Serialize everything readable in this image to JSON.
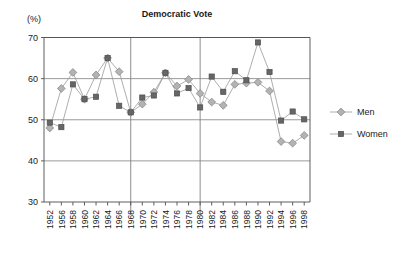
{
  "chart_data": {
    "type": "line",
    "title": "Democratic Vote",
    "ylabel": "(%)",
    "xlabel": "",
    "ylim": [
      30,
      70
    ],
    "yticks": [
      30,
      40,
      50,
      60,
      70
    ],
    "grid": true,
    "legend_position": "right",
    "categories": [
      "1952",
      "1956",
      "1958",
      "1960",
      "1962",
      "1964",
      "1966",
      "1968",
      "1970",
      "1972",
      "1974",
      "1976",
      "1978",
      "1980",
      "1982",
      "1984",
      "1986",
      "1988",
      "1990",
      "1992",
      "1994",
      "1996",
      "1998"
    ],
    "series": [
      {
        "name": "Men",
        "marker": "diamond",
        "color": "#b3b3b3",
        "values": [
          48.0,
          57.6,
          61.5,
          55.0,
          60.9,
          65.0,
          61.7,
          51.8,
          53.8,
          56.7,
          61.4,
          58.2,
          59.8,
          56.4,
          54.3,
          53.5,
          58.6,
          58.9,
          59.1,
          57.0,
          44.7,
          44.3,
          46.2
        ]
      },
      {
        "name": "Women",
        "marker": "square",
        "color": "#666666",
        "values": [
          49.3,
          48.2,
          58.6,
          55.0,
          55.6,
          65.0,
          53.4,
          51.8,
          55.4,
          55.9,
          61.4,
          56.4,
          57.7,
          53.0,
          60.5,
          56.8,
          61.8,
          59.6,
          68.8,
          61.6,
          49.8,
          52.0,
          50.1
        ]
      }
    ],
    "vertical_markers": [
      "1968",
      "1980"
    ]
  },
  "legend": {
    "entries": [
      {
        "label": "Men"
      },
      {
        "label": "Women"
      }
    ]
  },
  "colors": {
    "men": "#b3b3b3",
    "women": "#666666",
    "axis": "#4d4d4d",
    "grid": "#808080",
    "text": "#1a1a1a"
  }
}
